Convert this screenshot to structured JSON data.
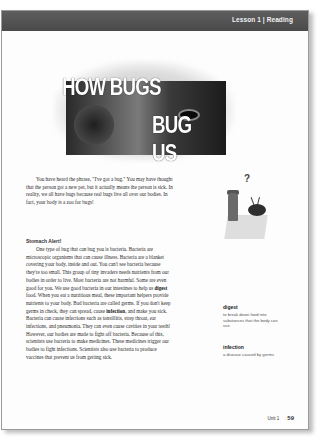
{
  "header": {
    "label": "Lesson 1 | Reading"
  },
  "title": {
    "line1": "HOW BUGS",
    "line2": "BUG US"
  },
  "intro_paragraph": "You have heard the phrase, \"I've got a bug.\" You may have thought that the person got a new pet, but it actually means the person is sick. In reality, we all have bugs because real bugs live all over our bodies. In fact, your body is a zoo for bugs!",
  "section": {
    "subheading": "Stomach Alert!",
    "paragraph_parts": [
      "One type of bug that can bug you is bacteria. Bacteria are microscopic organisms that can cause illness. Bacteria are a blanket covering your body, inside and out. You can't see bacteria because they're too small. This group of tiny invaders needs nutrients from our bodies in order to live. Most bacteria are not harmful. Some are even good for you. We use good bacteria in our intestines to help us ",
      "digest",
      " food. When you eat a nutritious meal, these important helpers provide nutrients to your body. Bad bacteria are called germs. If you don't keep germs in check, they can spread, cause ",
      "infection",
      ", and make you sick. Bacteria can cause infections such as tonsillitis, strep throat, ear infections, and pneumonia. They can even cause cavities in your teeth! However, our bodies are made to fight off bacteria. Because of this, scientists use bacteria to make medicines. These medicines trigger our bodies to fight infections. Scientists also use bacteria to produce vaccines that prevent us from getting sick."
    ]
  },
  "glossary": [
    {
      "term": "digest",
      "definition": "to break down food into substances that the body can use"
    },
    {
      "term": "infection",
      "definition": "a disease caused by germs"
    }
  ],
  "illustration": {
    "icon": "question-mark-bug-illustration",
    "symbol": "?"
  },
  "footer": {
    "unit": "Unit 1",
    "page_number": "59"
  }
}
